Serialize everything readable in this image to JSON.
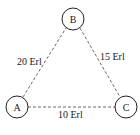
{
  "diagram": {
    "nodes": [
      {
        "id": "A",
        "label": "A",
        "cx": 17,
        "cy": 107,
        "r": 11
      },
      {
        "id": "B",
        "label": "B",
        "cx": 73,
        "cy": 19,
        "r": 11
      },
      {
        "id": "C",
        "label": "C",
        "cx": 126,
        "cy": 107,
        "r": 11
      }
    ],
    "edges": [
      {
        "from": "A",
        "to": "B",
        "label": "20 Erl",
        "style": "dashed"
      },
      {
        "from": "B",
        "to": "C",
        "label": "15 Erl",
        "style": "dashed"
      },
      {
        "from": "A",
        "to": "C",
        "label": "10 Erl",
        "style": "dashed"
      }
    ],
    "colors": {
      "stroke": "#222222",
      "background": "#ffffff"
    }
  }
}
